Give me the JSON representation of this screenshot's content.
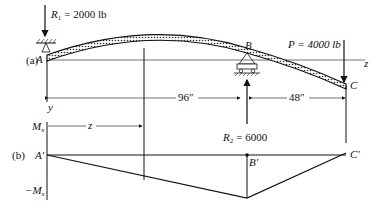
{
  "part_a": {
    "label": "(a)",
    "R1": {
      "symbol": "R",
      "sub": "1",
      "value": "= 2000 lb"
    },
    "P": {
      "value": "P = 4000 lb"
    },
    "R2": {
      "symbol": "R",
      "sub": "2",
      "value": "= 6000"
    },
    "points": {
      "A": "A",
      "B": "B",
      "C": "C"
    },
    "axis_z": "z",
    "axis_y": "y",
    "dim_AB": "96″",
    "dim_BC": "48″"
  },
  "part_b": {
    "label": "(b)",
    "Mx_pos": "M",
    "Mx_neg": "−M",
    "Mx_sub": "x",
    "z_label": "z",
    "points": {
      "A": "A′",
      "B": "B′",
      "C": "C′"
    }
  }
}
